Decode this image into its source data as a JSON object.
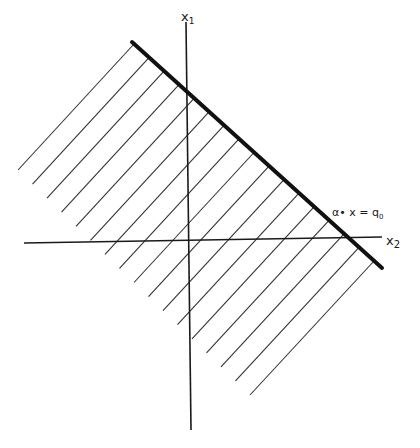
{
  "diagram": {
    "type": "half-plane-diagram",
    "axes": {
      "vertical_label": "x",
      "vertical_subscript": "1",
      "horizontal_label": "x",
      "horizontal_subscript": "2"
    },
    "boundary_line": {
      "label_alpha": "α",
      "label_rest": "• x = q",
      "label_subscript": "0"
    },
    "hatch_count": 17,
    "colors": {
      "ink": "#1a1a1a",
      "hatch": "#333333",
      "background": "#ffffff"
    }
  }
}
